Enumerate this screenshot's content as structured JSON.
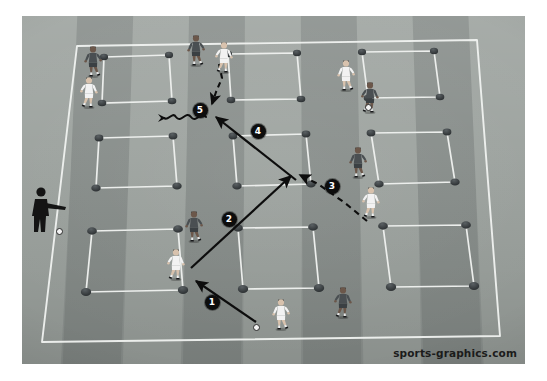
{
  "scene": {
    "type": "soccer-training-diagram",
    "title": "Soccer grid passing and dribbling drill",
    "watermark": "sports-graphics.com",
    "surface": "grass-pitch-with-mowing-stripes"
  },
  "colors": {
    "pitch_base": "#8e9491",
    "pitch_stripe_light": "#9aa09c",
    "pitch_stripe_dark": "#848a87",
    "boundary_line": "#f0f2f0",
    "grid_line": "#eceeec",
    "cone": "#2f3335",
    "marker_fill": "#0d0d0d",
    "marker_text": "#ffffff",
    "kit_white": "#f2f2f2",
    "kit_dark": "#4a4f52",
    "coach": "#141414",
    "ball": "#f2f2f2",
    "watermark_text": "#1b1b1b"
  },
  "field": {
    "boundary_label": "pitch-boundary",
    "grid": {
      "rows": 3,
      "cols": 3,
      "squares": 9,
      "cones_per_square": 4,
      "description": "Nine cone-marked squares arranged in a 3x3 grid"
    }
  },
  "markers": [
    {
      "id": "1",
      "label": "1",
      "kind": "pass",
      "line": "solid",
      "x": 212,
      "y": 302
    },
    {
      "id": "2",
      "label": "2",
      "kind": "pass",
      "line": "solid",
      "x": 229,
      "y": 219
    },
    {
      "id": "3",
      "label": "3",
      "kind": "run",
      "line": "dashed",
      "x": 332,
      "y": 186
    },
    {
      "id": "4",
      "label": "4",
      "kind": "pass",
      "line": "solid",
      "x": 258,
      "y": 131
    },
    {
      "id": "5",
      "label": "5",
      "kind": "dribble",
      "line": "wavy",
      "x": 200,
      "y": 110
    }
  ],
  "legend_semantics": {
    "solid_arrow": "pass",
    "dashed_arrow": "player run",
    "wavy_arrow": "dribble with the ball"
  },
  "players": [
    {
      "id": "p1",
      "kit": "dark",
      "name": "player-dark-top-left",
      "x": 80,
      "y": 44
    },
    {
      "id": "p2",
      "kit": "white",
      "name": "player-white-top-left",
      "x": 76,
      "y": 75
    },
    {
      "id": "p3",
      "kit": "dark",
      "name": "player-dark-top-centre",
      "x": 183,
      "y": 33
    },
    {
      "id": "p4",
      "kit": "white",
      "name": "player-white-top-centre",
      "x": 211,
      "y": 40
    },
    {
      "id": "p5",
      "kit": "white",
      "name": "player-white-top-right",
      "x": 333,
      "y": 58
    },
    {
      "id": "p6",
      "kit": "dark",
      "name": "player-dark-top-right",
      "x": 357,
      "y": 80
    },
    {
      "id": "p7",
      "kit": "dark",
      "name": "player-dark-mid-right",
      "x": 345,
      "y": 145
    },
    {
      "id": "p8",
      "kit": "white",
      "name": "player-white-mid-right",
      "x": 358,
      "y": 185
    },
    {
      "id": "p9",
      "kit": "dark",
      "name": "player-dark-mid-centre",
      "x": 181,
      "y": 209
    },
    {
      "id": "p10",
      "kit": "white",
      "name": "player-white-receiver",
      "x": 163,
      "y": 247
    },
    {
      "id": "p11",
      "kit": "white",
      "name": "player-white-passer",
      "x": 268,
      "y": 297
    },
    {
      "id": "p12",
      "kit": "dark",
      "name": "player-dark-bottom-centre",
      "x": 330,
      "y": 285
    }
  ],
  "balls": [
    {
      "id": "b1",
      "name": "ball-at-coach-feet",
      "x": 56,
      "y": 228
    },
    {
      "id": "b2",
      "name": "ball-at-passer-feet",
      "x": 253,
      "y": 324
    },
    {
      "id": "b3",
      "name": "ball-top-right",
      "x": 365,
      "y": 104
    }
  ],
  "coach": {
    "name": "coach-silhouette",
    "x": 28,
    "y": 186,
    "ball": "ball-at-coach-feet"
  }
}
